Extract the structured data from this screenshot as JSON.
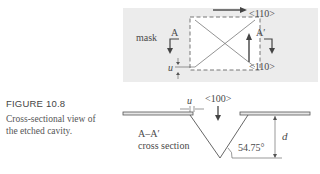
{
  "figure": {
    "label": "FIGURE 10.8",
    "caption_line1": "Cross-sectional view of",
    "caption_line2": "the etched cavity."
  },
  "top_view": {
    "mask_label": "mask",
    "section_start_label": "A",
    "section_end_label": "A′",
    "direction_top": "<110>",
    "direction_bottom": "<110>",
    "offset_label": "u",
    "colors": {
      "mask_fill": "#ececec",
      "opening_fill": "#ffffff",
      "dash": "#777777",
      "line": "#555555"
    }
  },
  "cross_section": {
    "label_line1": "A–A′",
    "label_line2": "cross section",
    "offset_label": "u",
    "direction_label": "<100>",
    "angle_label": "54.75°",
    "depth_label": "d"
  }
}
